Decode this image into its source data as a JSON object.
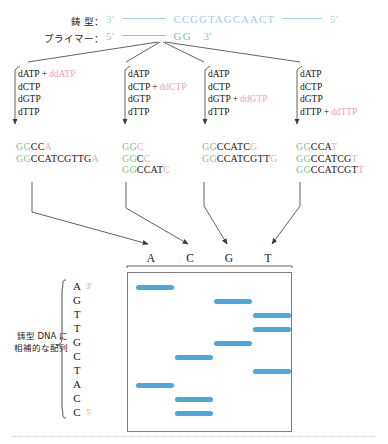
{
  "diagram": {
    "title_rows": {
      "template": {
        "label": "鋳 型：",
        "five_prime": "5'",
        "three_prime": "3'",
        "bases": "CCGGTAGCAACT"
      },
      "primer": {
        "label": "プライマー：",
        "five_prime": "5'",
        "three_prime": "3'",
        "bases": "GG"
      }
    },
    "reactions": [
      {
        "lane": "A",
        "mix": [
          {
            "dntp": "dATP",
            "plus": "+",
            "ddntp": "ddATP"
          },
          {
            "dntp": "dCTP",
            "plus": "",
            "ddntp": ""
          },
          {
            "dntp": "dGTP",
            "plus": "",
            "ddntp": ""
          },
          {
            "dntp": "dTTP",
            "plus": "",
            "ddntp": ""
          }
        ],
        "products": [
          {
            "primer": "GG",
            "body": "CC",
            "term": "A"
          },
          {
            "primer": "GG",
            "body": "CCATCGTTG",
            "term": "A"
          }
        ]
      },
      {
        "lane": "C",
        "mix": [
          {
            "dntp": "dATP",
            "plus": "",
            "ddntp": ""
          },
          {
            "dntp": "dCTP",
            "plus": "+",
            "ddntp": "ddCTP"
          },
          {
            "dntp": "dGTP",
            "plus": "",
            "ddntp": ""
          },
          {
            "dntp": "dTTP",
            "plus": "",
            "ddntp": ""
          }
        ],
        "products": [
          {
            "primer": "GG",
            "body": "",
            "term": "C"
          },
          {
            "primer": "GG",
            "body": "C",
            "term": "C"
          },
          {
            "primer": "GG",
            "body": "CCAT",
            "term": "C"
          }
        ]
      },
      {
        "lane": "G",
        "mix": [
          {
            "dntp": "dATP",
            "plus": "",
            "ddntp": ""
          },
          {
            "dntp": "dCTP",
            "plus": "",
            "ddntp": ""
          },
          {
            "dntp": "dGTP",
            "plus": "+",
            "ddntp": "ddGTP"
          },
          {
            "dntp": "dTTP",
            "plus": "",
            "ddntp": ""
          }
        ],
        "products": [
          {
            "primer": "GG",
            "body": "CCATC",
            "term": "G"
          },
          {
            "primer": "GG",
            "body": "CCATCGTT",
            "term": "G"
          }
        ]
      },
      {
        "lane": "T",
        "mix": [
          {
            "dntp": "dATP",
            "plus": "",
            "ddntp": ""
          },
          {
            "dntp": "dCTP",
            "plus": "",
            "ddntp": ""
          },
          {
            "dntp": "dGTP",
            "plus": "",
            "ddntp": ""
          },
          {
            "dntp": "dTTP",
            "plus": "+",
            "ddntp": "ddTTP"
          }
        ],
        "products": [
          {
            "primer": "GG",
            "body": "CCA",
            "term": "T"
          },
          {
            "primer": "GG",
            "body": "CCATCG",
            "term": "T"
          },
          {
            "primer": "GG",
            "body": "CCATCGT",
            "term": "T"
          }
        ]
      }
    ],
    "gel": {
      "lane_labels": [
        "A",
        "C",
        "G",
        "T"
      ],
      "readout": {
        "letters": [
          "A",
          "G",
          "T",
          "T",
          "G",
          "C",
          "T",
          "A",
          "C",
          "C"
        ],
        "three_prime": "3'",
        "five_prime": "5'",
        "caption_line1": "鋳型 DNA に",
        "caption_line2": "相補的な配列"
      },
      "bands": [
        {
          "lane": "A",
          "position": 1
        },
        {
          "lane": "G",
          "position": 2
        },
        {
          "lane": "T",
          "position": 3
        },
        {
          "lane": "T",
          "position": 4
        },
        {
          "lane": "G",
          "position": 5
        },
        {
          "lane": "C",
          "position": 6
        },
        {
          "lane": "T",
          "position": 7
        },
        {
          "lane": "A",
          "position": 8
        },
        {
          "lane": "C",
          "position": 9
        },
        {
          "lane": "C",
          "position": 10
        }
      ]
    },
    "colors": {
      "band": "#4ba8dc",
      "template_strand": "#a3cde0",
      "primer_strand": "#79c48f",
      "dideoxy": "#f0a3b4",
      "end_marker": "#e8a07e"
    }
  }
}
